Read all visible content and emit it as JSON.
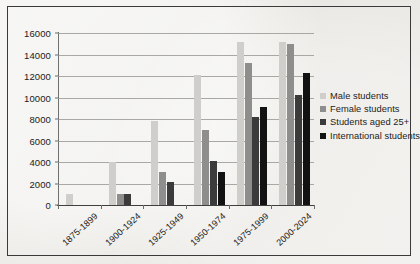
{
  "chart_data": {
    "type": "bar",
    "title": "",
    "xlabel": "",
    "ylabel": "",
    "ylim": [
      0,
      16000
    ],
    "ytick_step": 2000,
    "yticks": [
      0,
      2000,
      4000,
      6000,
      8000,
      10000,
      12000,
      14000,
      16000
    ],
    "ytick_labels": [
      "0",
      "2000",
      "4000",
      "6000",
      "8000",
      "10000",
      "12000",
      "14000",
      "16000"
    ],
    "grid": true,
    "grid_axis": "y",
    "legend_position": "right",
    "categories": [
      "1875-1899",
      "1900-1924",
      "1925-1949",
      "1950-1974",
      "1975-1999",
      "2000-2024"
    ],
    "series": [
      {
        "name": "Male students",
        "color": "#cfcecb",
        "values": [
          1000,
          4000,
          7800,
          12100,
          15200,
          15200
        ]
      },
      {
        "name": "Female students",
        "color": "#8e8e8c",
        "values": [
          0,
          1000,
          3100,
          7000,
          13200,
          15000
        ]
      },
      {
        "name": "Students aged 25+",
        "color": "#3b3b3b",
        "values": [
          0,
          1000,
          2100,
          4100,
          8200,
          10200
        ]
      },
      {
        "name": "International students",
        "color": "#121212",
        "values": [
          0,
          0,
          0,
          3100,
          9100,
          12300
        ]
      }
    ]
  },
  "style": {
    "background": "#e9e8e4",
    "border_color": "#3a3a3a",
    "gridline_color": "#a9a8a4",
    "axis_color": "#6a6a6a",
    "text_color": "#1d1d1c"
  }
}
